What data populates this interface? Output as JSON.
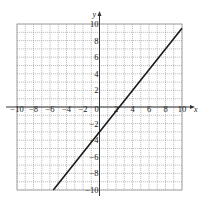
{
  "chart_data": {
    "type": "line",
    "title": "",
    "xlabel": "x",
    "ylabel": "y",
    "xlim": [
      -10,
      10
    ],
    "ylim": [
      -10,
      10
    ],
    "grid": true,
    "grid_step": 1,
    "x_ticks": [
      -10,
      -8,
      -6,
      -4,
      -2,
      0,
      2,
      4,
      6,
      8,
      10
    ],
    "y_ticks": [
      -10,
      -8,
      -6,
      -4,
      -2,
      2,
      4,
      6,
      8,
      10
    ],
    "x_tick_labels": [
      "−10",
      "−8",
      "−6",
      "−4",
      "−2",
      "0",
      "2",
      "4",
      "6",
      "8",
      "10"
    ],
    "y_tick_labels": [
      "−10",
      "−8",
      "−6",
      "−4",
      "−2",
      "2",
      "4",
      "6",
      "8",
      "10"
    ],
    "series": [
      {
        "name": "line",
        "x": [
          -5.6,
          10
        ],
        "y": [
          -10,
          9.5
        ],
        "slope": 1.25,
        "y_intercept": -3,
        "x_intercept": 2.4
      }
    ],
    "legend": "none"
  },
  "colors": {
    "grid": "#9a9a9a",
    "axis": "#333333",
    "line": "#1a1a1a"
  }
}
